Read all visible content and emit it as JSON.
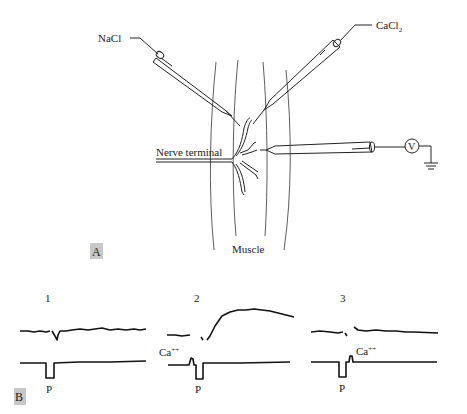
{
  "panel_a": {
    "label": "A",
    "electrodes": {
      "left_solution": "NaCl",
      "right_solution": "CaCl",
      "right_solution_subscript": "2"
    },
    "nerve_label": "Nerve terminal",
    "muscle_label": "Muscle",
    "meter_label": "V",
    "ground_icon": "ground-symbol"
  },
  "panel_b": {
    "label": "B",
    "traces": [
      {
        "number": "1",
        "stimulus_label": "P",
        "ca_label": "",
        "response": "small"
      },
      {
        "number": "2",
        "stimulus_label": "P",
        "ca_label": "Ca++",
        "ca_superscript": "++",
        "ca_base": "Ca",
        "response": "large"
      },
      {
        "number": "3",
        "stimulus_label": "P",
        "ca_label": "Ca++",
        "ca_superscript": "++",
        "ca_base": "Ca",
        "response": "small"
      }
    ]
  }
}
